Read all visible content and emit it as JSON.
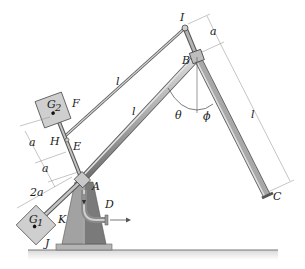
{
  "diagram": {
    "points": {
      "I": "I",
      "B": "B",
      "A": "A",
      "C": "C",
      "D": "D",
      "E": "E",
      "F": "F",
      "H": "H",
      "J": "J",
      "K": "K"
    },
    "masses": {
      "G1": "G",
      "G1_sub": "1",
      "G2": "G",
      "G2_sub": "2"
    },
    "lengths": {
      "bar_IH": "l",
      "bar_AB": "l",
      "bar_BC": "l",
      "dim_IB": "a",
      "dim_upper": "a",
      "dim_middle": "a",
      "dim_lower": "2a"
    },
    "angles": {
      "theta": "θ",
      "phi": "ϕ"
    },
    "colors": {
      "bar_fill": "#a9a9a9",
      "bar_highlight": "#d6d6d6",
      "bar_edge": "#555555",
      "box_fill": "#cfcfcf",
      "base_left": "#a2a2a2",
      "base_right": "#7a7a7a",
      "dim_line": "#8a8a8a"
    }
  }
}
